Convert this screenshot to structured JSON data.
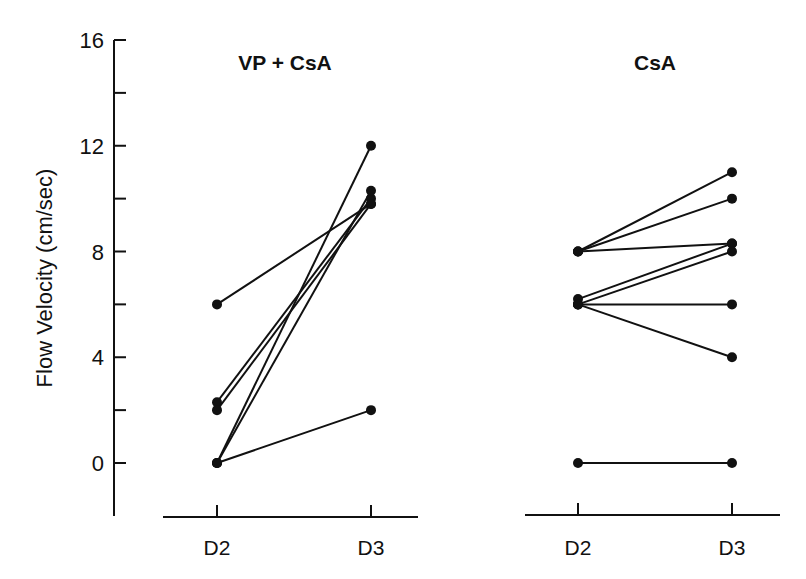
{
  "chart_data": {
    "type": "line",
    "ylabel": "Flow Velocity (cm/sec)",
    "ylim": [
      -2.5,
      16
    ],
    "yticks": [
      0,
      2,
      4,
      6,
      8,
      10,
      12,
      14,
      16
    ],
    "ytick_labels": [
      "0",
      "4",
      "8",
      "12",
      "16"
    ],
    "grid": false,
    "panels": [
      {
        "title": "VP + CsA",
        "categories": [
          "D2",
          "D3"
        ],
        "series": [
          {
            "name": "subject-1",
            "values": [
              6.0,
              9.8
            ]
          },
          {
            "name": "subject-2",
            "values": [
              2.3,
              10.0
            ]
          },
          {
            "name": "subject-3",
            "values": [
              2.0,
              9.8
            ]
          },
          {
            "name": "subject-4",
            "values": [
              0.0,
              12.0
            ]
          },
          {
            "name": "subject-5",
            "values": [
              0.0,
              10.3
            ]
          },
          {
            "name": "subject-6",
            "values": [
              0.0,
              2.0
            ]
          }
        ]
      },
      {
        "title": "CsA",
        "categories": [
          "D2",
          "D3"
        ],
        "series": [
          {
            "name": "subject-1",
            "values": [
              8.0,
              11.0
            ]
          },
          {
            "name": "subject-2",
            "values": [
              8.0,
              10.0
            ]
          },
          {
            "name": "subject-3",
            "values": [
              8.0,
              8.3
            ]
          },
          {
            "name": "subject-4",
            "values": [
              6.2,
              8.3
            ]
          },
          {
            "name": "subject-5",
            "values": [
              6.0,
              8.0
            ]
          },
          {
            "name": "subject-6",
            "values": [
              6.0,
              6.0
            ]
          },
          {
            "name": "subject-7",
            "values": [
              6.0,
              4.0
            ]
          },
          {
            "name": "subject-8",
            "values": [
              0.0,
              0.0
            ]
          }
        ]
      }
    ]
  }
}
